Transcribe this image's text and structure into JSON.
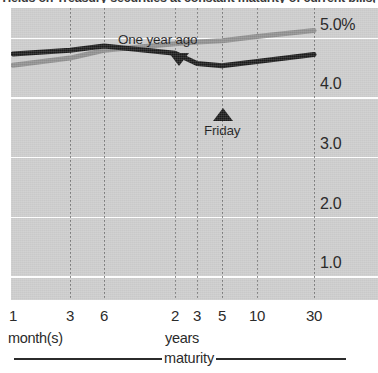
{
  "chart_data": {
    "type": "line",
    "title": "Yields on Treasury securities at constant maturity of current bills, notes, and bonds.",
    "xlabel": "maturity",
    "ylabel": "",
    "ylim": [
      0.6,
      5.5
    ],
    "yticks": [
      "1.0",
      "2.0",
      "3.0",
      "4.0",
      "5.0%"
    ],
    "ytick_values": [
      1.0,
      2.0,
      3.0,
      4.0,
      5.0
    ],
    "grid": true,
    "legend_position": "inline-annotation",
    "categories": [
      "1",
      "3",
      "6",
      "2",
      "3",
      "5",
      "10",
      "30"
    ],
    "category_groups": [
      {
        "label": "month(s)",
        "categories": [
          "1",
          "3",
          "6"
        ]
      },
      {
        "label": "years",
        "categories": [
          "2",
          "3",
          "5",
          "10",
          "30"
        ]
      }
    ],
    "series": [
      {
        "name": "One year ago",
        "color": "#8c8c8c",
        "values": [
          4.54,
          4.66,
          4.79,
          4.9,
          4.93,
          4.95,
          5.02,
          5.12
        ]
      },
      {
        "name": "Friday",
        "color": "#1a1a1a",
        "values": [
          4.73,
          4.79,
          4.86,
          4.74,
          4.57,
          4.53,
          4.6,
          4.72
        ]
      }
    ],
    "annotations": [
      {
        "text": "One year ago",
        "series": "One year ago",
        "marker": "arrow-down",
        "at_category": "2"
      },
      {
        "text": "Friday",
        "series": "Friday",
        "marker": "arrow-up",
        "at_category": "5"
      }
    ]
  },
  "axis": {
    "x_caption": "maturity",
    "x_group_months": "month(s)",
    "x_group_years": "years"
  }
}
